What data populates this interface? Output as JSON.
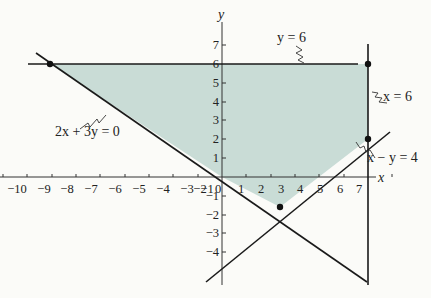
{
  "figure": {
    "axis_labels": {
      "x": "x",
      "y": "y"
    },
    "x_ticks": [
      "−10",
      "−9",
      "−8",
      "−7",
      "−6",
      "−5",
      "−4",
      "−3",
      "−2",
      "−1",
      "0",
      "1",
      "2",
      "3",
      "4",
      "5",
      "6",
      "7"
    ],
    "y_ticks_positive": [
      "1",
      "2",
      "3",
      "4",
      "5",
      "6",
      "7"
    ],
    "y_ticks_negative": [
      "−1",
      "−2",
      "−3",
      "−4"
    ],
    "lines": [
      {
        "id": "y6",
        "label": "y = 6"
      },
      {
        "id": "x6",
        "label": "x = 6"
      },
      {
        "id": "xy4",
        "label": "x − y = 4"
      },
      {
        "id": "2x3y0",
        "label": "2x + 3y = 0"
      }
    ],
    "vertices": [
      {
        "x": -9,
        "y": 6
      },
      {
        "x": 6,
        "y": 6
      },
      {
        "x": 6,
        "y": 2
      },
      {
        "x": 2.4,
        "y": -1.6
      }
    ],
    "fill_color": "#c9dcd6",
    "line_color": "#1a1a1a"
  }
}
